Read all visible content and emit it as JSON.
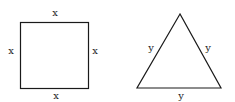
{
  "square": {
    "labels": {
      "top": "x",
      "left": "x",
      "right": "x",
      "bottom": "x"
    }
  },
  "triangle": {
    "labels": {
      "left": "y",
      "right": "y",
      "bottom": "y"
    }
  },
  "colors": {
    "stroke": "#1a1a1a",
    "text": "#222222"
  }
}
